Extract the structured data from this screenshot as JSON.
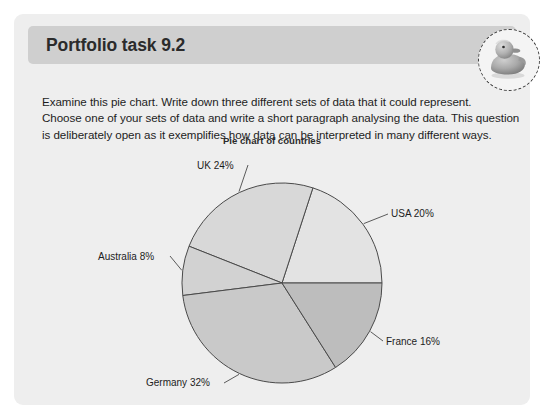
{
  "card": {
    "title": "Portfolio task 9.2",
    "badge_icon": "rubber-duck-icon",
    "body_lines": [
      "Examine this pie chart. Write down three different sets of data that it could represent.",
      "Choose one of your sets of data and write a short paragraph analysing the data. This question",
      "is deliberately open as it exemplifies how data can be interpreted in many different ways."
    ]
  },
  "colors": {
    "card_background": "#eeeeee",
    "title_bar": "#cfcfcf",
    "page_background": "#ffffff",
    "slice_outline": "#4a4a4a",
    "text": "#1d1d1d"
  },
  "chart_data": {
    "type": "pie",
    "title": "Pie chart of countries",
    "xlabel": "",
    "ylabel": "",
    "grid": false,
    "legend_position": "none",
    "labels_outside": true,
    "categories": [
      "USA",
      "UK",
      "Australia",
      "Germany",
      "France"
    ],
    "values": [
      20,
      24,
      8,
      32,
      16
    ],
    "units": "%",
    "start_angle_deg": 0,
    "direction": "counterclockwise",
    "slices": [
      {
        "label": "USA 20%",
        "name": "USA",
        "value": 20,
        "color": "#e3e3e3",
        "start_deg": 0,
        "end_deg": 72
      },
      {
        "label": "UK 24%",
        "name": "UK",
        "value": 24,
        "color": "#d8d8d8",
        "start_deg": 72,
        "end_deg": 158.4
      },
      {
        "label": "Australia 8%",
        "name": "Australia",
        "value": 8,
        "color": "#d2d2d2",
        "start_deg": 158.4,
        "end_deg": 187.2
      },
      {
        "label": "Germany 32%",
        "name": "Germany",
        "value": 32,
        "color": "#c9c9c9",
        "start_deg": 187.2,
        "end_deg": 302.4
      },
      {
        "label": "France 16%",
        "name": "France",
        "value": 16,
        "color": "#bdbdbd",
        "start_deg": 302.4,
        "end_deg": 360
      }
    ]
  }
}
